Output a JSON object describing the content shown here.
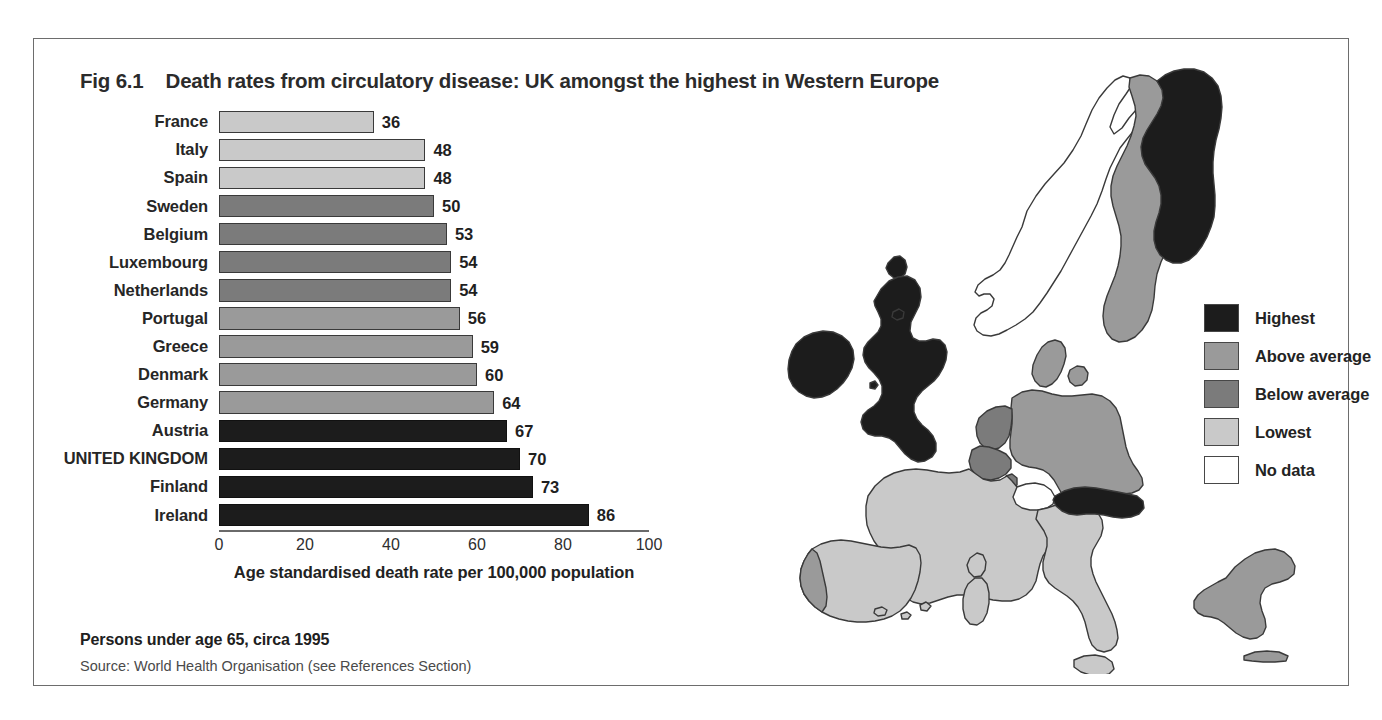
{
  "figure": {
    "number": "Fig 6.1",
    "title": "Death rates from circulatory disease:  UK amongst the highest in Western Europe",
    "footnote": "Persons under age 65, circa 1995",
    "source": "Source: World Health Organisation (see References Section)"
  },
  "palette": {
    "highest": "#1c1c1c",
    "above_average": "#9a9a9a",
    "below_average": "#7b7b7b",
    "lowest": "#c9c9c9",
    "no_data": "#ffffff",
    "outline": "#3a3a3a",
    "frame": "#6d6d6d"
  },
  "legend": {
    "items": [
      {
        "label": "Highest",
        "color": "#1c1c1c",
        "key": "highest"
      },
      {
        "label": "Above average",
        "color": "#9a9a9a",
        "key": "above_average"
      },
      {
        "label": "Below average",
        "color": "#7b7b7b",
        "key": "below_average"
      },
      {
        "label": "Lowest",
        "color": "#c9c9c9",
        "key": "lowest"
      },
      {
        "label": "No data",
        "color": "#ffffff",
        "key": "no_data"
      }
    ]
  },
  "chart_data": {
    "type": "bar",
    "orientation": "horizontal",
    "title": "Fig 6.1 Death rates from circulatory disease: UK amongst the highest in Western Europe",
    "subtitle": "Persons under age 65, circa 1995",
    "xlabel": "Age standardised death rate per 100,000 population",
    "ylabel": "",
    "xlim": [
      0,
      100
    ],
    "xticks": [
      0,
      20,
      40,
      60,
      80,
      100
    ],
    "xtick_labels": [
      "0",
      "20",
      "40",
      "60",
      "80",
      "100"
    ],
    "grid": false,
    "legend_position": "map-right",
    "categories": [
      "France",
      "Italy",
      "Spain",
      "Sweden",
      "Belgium",
      "Luxembourg",
      "Netherlands",
      "Portugal",
      "Greece",
      "Denmark",
      "Germany",
      "Austria",
      "UNITED KINGDOM",
      "Finland",
      "Ireland"
    ],
    "values": [
      36,
      48,
      48,
      50,
      53,
      54,
      54,
      56,
      59,
      60,
      64,
      67,
      70,
      73,
      86
    ],
    "value_labels": [
      "36",
      "48",
      "48",
      "50",
      "53",
      "54",
      "54",
      "56",
      "59",
      "60",
      "64",
      "67",
      "70",
      "73",
      "86"
    ],
    "bar_classes": [
      "lowest",
      "lowest",
      "lowest",
      "below_average",
      "below_average",
      "below_average",
      "below_average",
      "above_average",
      "above_average",
      "above_average",
      "above_average",
      "highest",
      "highest",
      "highest",
      "highest"
    ],
    "bar_colors": [
      "#c9c9c9",
      "#c9c9c9",
      "#c9c9c9",
      "#7b7b7b",
      "#7b7b7b",
      "#7b7b7b",
      "#7b7b7b",
      "#9a9a9a",
      "#9a9a9a",
      "#9a9a9a",
      "#9a9a9a",
      "#1c1c1c",
      "#1c1c1c",
      "#1c1c1c",
      "#1c1c1c"
    ]
  },
  "map": {
    "name": "western-europe-choropleth",
    "regions": [
      {
        "name": "Ireland",
        "class": "highest"
      },
      {
        "name": "United Kingdom",
        "class": "highest"
      },
      {
        "name": "Finland",
        "class": "highest"
      },
      {
        "name": "Austria",
        "class": "highest"
      },
      {
        "name": "Sweden",
        "class": "above_average"
      },
      {
        "name": "Denmark",
        "class": "above_average"
      },
      {
        "name": "Germany",
        "class": "above_average"
      },
      {
        "name": "Greece",
        "class": "above_average"
      },
      {
        "name": "Portugal",
        "class": "above_average"
      },
      {
        "name": "Belgium",
        "class": "below_average"
      },
      {
        "name": "Netherlands",
        "class": "below_average"
      },
      {
        "name": "Luxembourg",
        "class": "below_average"
      },
      {
        "name": "France",
        "class": "lowest"
      },
      {
        "name": "Spain",
        "class": "lowest"
      },
      {
        "name": "Italy",
        "class": "lowest"
      },
      {
        "name": "Norway",
        "class": "no_data"
      },
      {
        "name": "Switzerland",
        "class": "no_data"
      }
    ]
  }
}
